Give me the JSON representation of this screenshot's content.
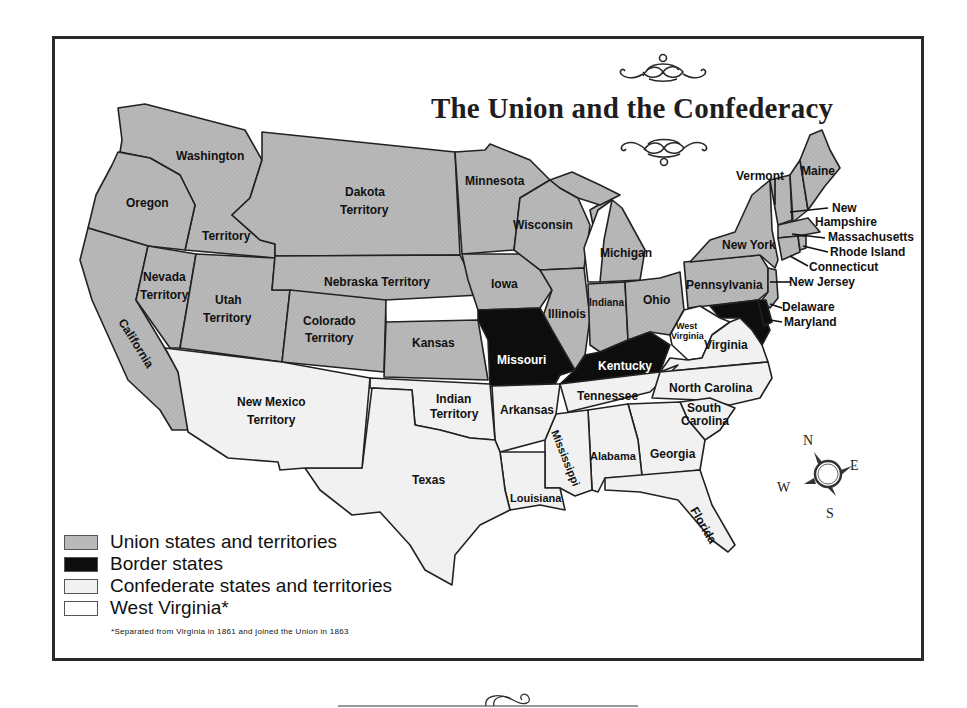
{
  "title": "The Union and the Confederacy",
  "colors": {
    "union": "#b9b9b9",
    "border": "#0d0d0d",
    "confederate": "#f1f1f1",
    "west_virginia": "#ffffff",
    "outline": "#222222"
  },
  "legend": {
    "items": [
      {
        "label": "Union states and territories",
        "color": "#b9b9b9"
      },
      {
        "label": "Border states",
        "color": "#0d0d0d"
      },
      {
        "label": "Confederate states and territories",
        "color": "#f1f1f1"
      },
      {
        "label": "West Virginia*",
        "color": "#ffffff"
      }
    ],
    "footnote": "*Separated from Virginia in 1861 and joined the Union in 1863"
  },
  "compass": {
    "n": "N",
    "e": "E",
    "s": "S",
    "w": "W"
  },
  "regions": {
    "union": [
      "Washington Territory",
      "Oregon",
      "California",
      "Nevada Territory",
      "Utah Territory",
      "Colorado Territory",
      "Dakota Territory",
      "Nebraska Territory",
      "Kansas",
      "Minnesota",
      "Iowa",
      "Wisconsin",
      "Illinois",
      "Michigan",
      "Indiana",
      "Ohio",
      "Pennsylvania",
      "New York",
      "Vermont",
      "Maine",
      "New Hampshire",
      "Massachusetts",
      "Rhode Island",
      "Connecticut",
      "New Jersey"
    ],
    "border": [
      "Missouri",
      "Kentucky",
      "Delaware",
      "Maryland"
    ],
    "confederate": [
      "New Mexico Territory",
      "Texas",
      "Indian Territory",
      "Arkansas",
      "Louisiana",
      "Mississippi",
      "Alabama",
      "Georgia",
      "Florida",
      "Tennessee",
      "North Carolina",
      "South Carolina",
      "Virginia"
    ],
    "west_virginia": [
      "West Virginia"
    ]
  },
  "labels": {
    "washington": "Washington",
    "territory_wa": "Territory",
    "oregon": "Oregon",
    "california": "California",
    "nevada_1": "Nevada",
    "nevada_2": "Territory",
    "utah_1": "Utah",
    "utah_2": "Territory",
    "colorado_1": "Colorado",
    "colorado_2": "Territory",
    "dakota_1": "Dakota",
    "dakota_2": "Territory",
    "nebraska": "Nebraska Territory",
    "kansas": "Kansas",
    "minnesota": "Minnesota",
    "iowa": "Iowa",
    "wisconsin": "Wisconsin",
    "illinois": "Illinois",
    "michigan": "Michigan",
    "indiana": "Indiana",
    "ohio": "Ohio",
    "pennsylvania": "Pennsylvania",
    "new_york": "New York",
    "vermont": "Vermont",
    "maine": "Maine",
    "new_hampshire_1": "New",
    "new_hampshire_2": "Hampshire",
    "massachusetts": "Massachusetts",
    "rhode_island": "Rhode Island",
    "connecticut": "Connecticut",
    "new_jersey": "New Jersey",
    "delaware": "Delaware",
    "maryland": "Maryland",
    "missouri": "Missouri",
    "kentucky": "Kentucky",
    "west_virginia_1": "West",
    "west_virginia_2": "Virginia",
    "virginia": "Virginia",
    "new_mexico_1": "New Mexico",
    "new_mexico_2": "Territory",
    "texas": "Texas",
    "indian_1": "Indian",
    "indian_2": "Territory",
    "arkansas": "Arkansas",
    "louisiana": "Louisiana",
    "mississippi": "Mississippi",
    "alabama": "Alabama",
    "georgia": "Georgia",
    "florida": "Florida",
    "tennessee": "Tennessee",
    "north_carolina": "North Carolina",
    "south_carolina_1": "South",
    "south_carolina_2": "Carolina"
  }
}
